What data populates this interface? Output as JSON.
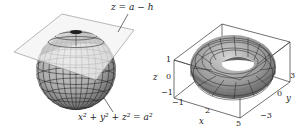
{
  "figures": [
    {
      "id": "sphere-plane",
      "description": "Sphere cut by horizontal plane",
      "labels": {
        "plane_equation": "z = a − h",
        "sphere_equation": "x² + y² + z² = a²"
      }
    },
    {
      "id": "torus",
      "description": "Torus inside bounding box with axes",
      "axes": {
        "x": {
          "name": "x",
          "ticks": [
            "−1",
            "2",
            "5"
          ]
        },
        "y": {
          "name": "y",
          "ticks": [
            "−3",
            "0",
            "3"
          ]
        },
        "z": {
          "name": "z",
          "ticks": [
            "1",
            "0",
            "−1"
          ]
        }
      }
    }
  ],
  "colors": {
    "surface_light": "#c8c8c8",
    "surface_dark": "#6a6a6a",
    "mesh": "#2b2b2b",
    "plane": "#eeeeee",
    "box": "#333333"
  }
}
